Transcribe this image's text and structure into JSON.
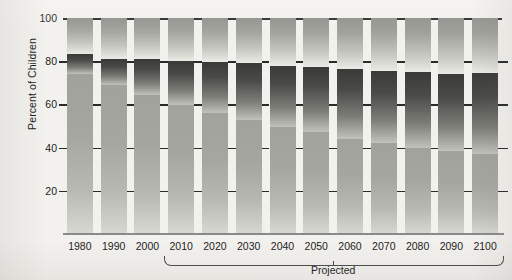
{
  "chart_data": {
    "type": "bar",
    "stacked": true,
    "title": "",
    "xlabel": "",
    "ylabel": "Percent of Children",
    "ylim": [
      0,
      100
    ],
    "xtick_labels": [
      "1980",
      "1990",
      "2000",
      "2010",
      "2020",
      "2030",
      "2040",
      "2050",
      "2060",
      "2070",
      "2080",
      "2090",
      "2100"
    ],
    "ytick_labels": [
      "20",
      "40",
      "60",
      "80",
      "100"
    ],
    "ytick_values": [
      20,
      40,
      60,
      80,
      100
    ],
    "grid": false,
    "legend": false,
    "annotations": [
      {
        "text": "Projected",
        "span": [
          "2010",
          "2100"
        ]
      }
    ],
    "categories": [
      "1980",
      "1990",
      "2000",
      "2010",
      "2020",
      "2030",
      "2040",
      "2050",
      "2060",
      "2070",
      "2080",
      "2090",
      "2100"
    ],
    "series": [
      {
        "name": "bottom-segment",
        "color": "#a6a6a0",
        "values": [
          74,
          69,
          64.5,
          59.5,
          56,
          53,
          49.5,
          47,
          44,
          42,
          40,
          38.5,
          37
        ]
      },
      {
        "name": "middle-segment",
        "color": "#4a4a47",
        "values": [
          9.5,
          12,
          16.5,
          20.5,
          23.5,
          26,
          28.5,
          30.5,
          32.5,
          33.5,
          35,
          35.5,
          37.5
        ]
      },
      {
        "name": "top-segment",
        "color": "#a3a39d",
        "values": [
          16.5,
          19,
          19,
          20,
          20.5,
          21,
          22,
          22.5,
          23.5,
          24.5,
          25,
          26,
          25.5
        ]
      }
    ],
    "segment_tops": {
      "bottom": [
        74,
        69,
        64.5,
        59.5,
        56,
        53,
        49.5,
        47,
        44,
        42,
        40,
        38.5,
        37
      ],
      "middle": [
        83.5,
        81,
        81,
        80,
        79.5,
        79,
        78,
        77.5,
        76.5,
        75.5,
        75,
        74,
        74.5
      ],
      "top": [
        100,
        100,
        100,
        100,
        100,
        100,
        100,
        100,
        100,
        100,
        100,
        100,
        100
      ]
    }
  },
  "axis": {
    "y_title": "Percent of Children"
  },
  "footer": {
    "projected_label": "Projected"
  }
}
